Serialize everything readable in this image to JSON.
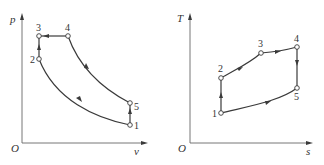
{
  "diagrams": [
    {
      "name": "p-v diagram",
      "axes": {
        "origin": "O",
        "x_label": "v",
        "y_label": "p"
      },
      "points": [
        {
          "label": "1",
          "x": 130,
          "y": 125
        },
        {
          "label": "2",
          "x": 39,
          "y": 59
        },
        {
          "label": "3",
          "x": 39,
          "y": 36
        },
        {
          "label": "4",
          "x": 68,
          "y": 36
        },
        {
          "label": "5",
          "x": 130,
          "y": 103
        }
      ],
      "processes": [
        "1→2 compression curve",
        "2→3 vertical (constant volume)",
        "3→4 horizontal (constant pressure)",
        "4→5 expansion curve",
        "5→1 vertical (constant volume)"
      ]
    },
    {
      "name": "T-s diagram",
      "axes": {
        "origin": "O",
        "x_label": "s",
        "y_label": "T"
      },
      "points": [
        {
          "label": "1",
          "x": 221,
          "y": 113
        },
        {
          "label": "2",
          "x": 221,
          "y": 78
        },
        {
          "label": "3",
          "x": 261,
          "y": 53
        },
        {
          "label": "4",
          "x": 297,
          "y": 47
        },
        {
          "label": "5",
          "x": 297,
          "y": 88
        }
      ],
      "processes": [
        "1→2 vertical",
        "2→3 curve",
        "3→4 curve",
        "4→5 vertical",
        "5→1 curve"
      ]
    }
  ],
  "labels": {
    "pv_origin": "O",
    "pv_x": "v",
    "pv_y": "p",
    "ts_origin": "O",
    "ts_x": "s",
    "ts_y": "T",
    "p1": "1",
    "p2": "2",
    "p3": "3",
    "p4": "4",
    "p5": "5"
  }
}
